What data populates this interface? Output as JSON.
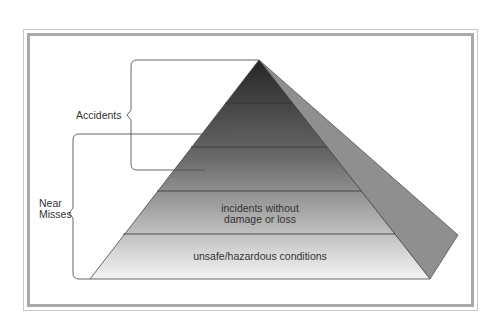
{
  "diagram": {
    "type": "pyramid",
    "layers_top_to_bottom": 5,
    "brackets": [
      {
        "label": "Accidents"
      },
      {
        "label_lines": [
          "Near",
          "Misses"
        ]
      }
    ],
    "layer_labels": {
      "layer4": [
        "incidents without",
        "damage or loss"
      ],
      "layer5": "unsafe/hazardous conditions"
    },
    "colors": {
      "frame": "#a9a9a9",
      "side_face": "#8f8f8f",
      "top_dark": "#2a2a2a",
      "bottom_light": "#f2f2f2",
      "line": "#333333"
    }
  }
}
